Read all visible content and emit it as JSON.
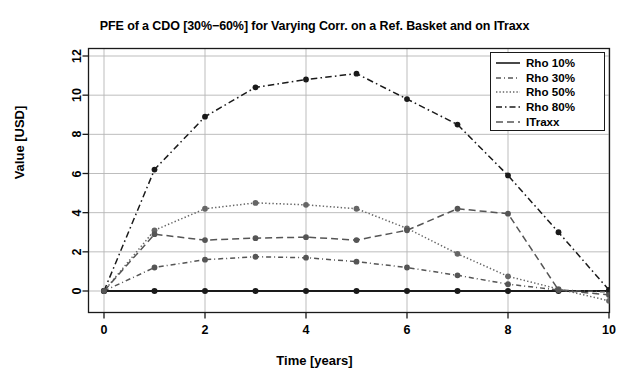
{
  "chart_data": {
    "type": "line",
    "title": "PFE of a CDO [30%−60%] for Varying Corr. on a Ref. Basket and on ITraxx",
    "xlabel": "Time [years]",
    "ylabel": "Value [USD]",
    "x": [
      0,
      1,
      2,
      3,
      4,
      5,
      6,
      7,
      8,
      9,
      10
    ],
    "xlim": [
      0,
      10
    ],
    "ylim": [
      -1.1,
      12.9
    ],
    "xticks": [
      "0",
      "2",
      "4",
      "6",
      "8",
      "10"
    ],
    "xtick_values": [
      0,
      2,
      4,
      6,
      8,
      10
    ],
    "yticks": [
      "0",
      "2",
      "4",
      "6",
      "8",
      "10",
      "12"
    ],
    "ytick_values": [
      0,
      2,
      4,
      6,
      8,
      10,
      12
    ],
    "grid": true,
    "legend_position": "top-right",
    "markers": "filled-circle",
    "series": [
      {
        "name": "Rho 10%",
        "style": "solid",
        "color": "#1a1a1a",
        "values": [
          0,
          0,
          0,
          0,
          0,
          0,
          0,
          0,
          0,
          0,
          0
        ]
      },
      {
        "name": "Rho 30%",
        "style": "dashdot",
        "color": "#555555",
        "values": [
          0,
          1.2,
          1.6,
          1.75,
          1.7,
          1.5,
          1.2,
          0.8,
          0.35,
          0.05,
          -0.05
        ]
      },
      {
        "name": "Rho 50%",
        "style": "dotted",
        "color": "#666666",
        "values": [
          0,
          3.1,
          4.2,
          4.5,
          4.4,
          4.2,
          3.2,
          1.9,
          0.75,
          0.1,
          -0.5
        ]
      },
      {
        "name": "Rho 80%",
        "style": "longdashdot",
        "color": "#1a1a1a",
        "values": [
          0,
          6.2,
          8.9,
          10.4,
          10.8,
          11.1,
          9.8,
          8.5,
          5.9,
          3.0,
          0.05
        ]
      },
      {
        "name": "ITraxx",
        "style": "dashed",
        "color": "#555555",
        "values": [
          0,
          2.9,
          2.6,
          2.7,
          2.75,
          2.6,
          3.1,
          4.2,
          3.95,
          0.05,
          -0.2
        ]
      }
    ]
  },
  "legend": {
    "items": [
      {
        "label": "Rho 10%"
      },
      {
        "label": "Rho 30%"
      },
      {
        "label": "Rho 50%"
      },
      {
        "label": "Rho 80%"
      },
      {
        "label": "ITraxx"
      }
    ]
  },
  "colors": {
    "axis": "#1a1a1a",
    "grid": "#b5b5b5",
    "background": "#ffffff"
  }
}
